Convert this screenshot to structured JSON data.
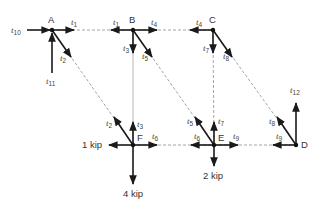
{
  "figure": {
    "type": "truss free-body diagram",
    "joints": [
      {
        "id": "A",
        "x": 52,
        "y": 30
      },
      {
        "id": "B",
        "x": 133,
        "y": 30
      },
      {
        "id": "C",
        "x": 213,
        "y": 30
      },
      {
        "id": "F",
        "x": 133,
        "y": 145
      },
      {
        "id": "E",
        "x": 214,
        "y": 145
      },
      {
        "id": "D",
        "x": 296,
        "y": 145
      }
    ],
    "members": [
      {
        "name": "t1",
        "from": "A",
        "to": "B",
        "style": "dashed"
      },
      {
        "name": "t4",
        "from": "B",
        "to": "C",
        "style": "dashed"
      },
      {
        "name": "t2",
        "from": "A",
        "to": "F",
        "style": "dashed"
      },
      {
        "name": "t3",
        "from": "B",
        "to": "F",
        "style": "solid-light"
      },
      {
        "name": "t5",
        "from": "B",
        "to": "E",
        "style": "dashed"
      },
      {
        "name": "t7",
        "from": "C",
        "to": "E",
        "style": "dashed"
      },
      {
        "name": "t8",
        "from": "C",
        "to": "D",
        "style": "dashed"
      },
      {
        "name": "t6",
        "from": "F",
        "to": "E",
        "style": "dashed"
      },
      {
        "name": "t9",
        "from": "E",
        "to": "D",
        "style": "dashed"
      }
    ],
    "reactions": [
      {
        "name": "t10",
        "joint": "A",
        "direction": "right"
      },
      {
        "name": "t11",
        "joint": "A",
        "direction": "up"
      },
      {
        "name": "t12",
        "joint": "D",
        "direction": "up"
      }
    ],
    "loads": [
      {
        "label": "1 kip",
        "joint": "F",
        "direction": "left"
      },
      {
        "label": "4 kip",
        "joint": "F",
        "direction": "down"
      },
      {
        "label": "2 kip",
        "joint": "E",
        "direction": "down"
      }
    ],
    "labels": {
      "A": "A",
      "B": "B",
      "C": "C",
      "D": "D",
      "E": "E",
      "F": "F",
      "t": "t",
      "s1": "1",
      "s2": "2",
      "s3": "3",
      "s4": "4",
      "s5": "5",
      "s6": "6",
      "s7": "7",
      "s8": "8",
      "s9": "9",
      "s10": "10",
      "s11": "11",
      "s12": "12",
      "load_1kip": "1 kip",
      "load_4kip": "4 kip",
      "load_2kip": "2 kip"
    }
  }
}
